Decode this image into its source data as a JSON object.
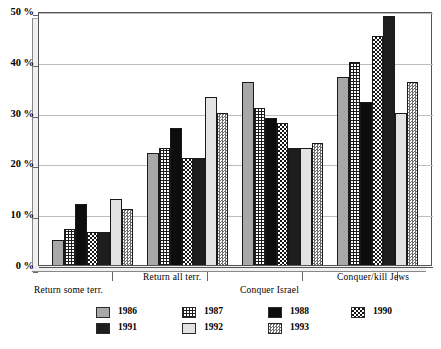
{
  "chart_data": {
    "type": "bar",
    "title": "",
    "subtitle": "",
    "xlabel": "",
    "ylabel": "",
    "ylim": [
      0,
      50
    ],
    "ytick_labels": [
      "0 %",
      "10 %",
      "20 %",
      "30 %",
      "40 %",
      "50 %"
    ],
    "ytick_values": [
      0,
      10,
      20,
      30,
      40,
      50
    ],
    "yaxis_unit": "%",
    "grid": true,
    "legend_position": "bottom",
    "categories": [
      "Return some terr.",
      "Return all terr.",
      "Conquer Israel",
      "Conquer/kill Jews"
    ],
    "series": [
      {
        "name": "1986",
        "pattern": "solid-gray",
        "values": [
          5,
          22,
          36,
          37
        ]
      },
      {
        "name": "1987",
        "pattern": "fine-grid",
        "values": [
          7,
          23,
          31,
          40
        ]
      },
      {
        "name": "1988",
        "pattern": "solid-black",
        "values": [
          12,
          27,
          29,
          32
        ]
      },
      {
        "name": "1990",
        "pattern": "checkerboard-dark",
        "values": [
          6.5,
          21,
          28,
          45
        ]
      },
      {
        "name": "1991",
        "pattern": "solid-dark",
        "values": [
          6.5,
          21,
          23,
          49
        ]
      },
      {
        "name": "1992",
        "pattern": "solid-light",
        "values": [
          13,
          33,
          23,
          30
        ]
      },
      {
        "name": "1993",
        "pattern": "checkerboard-gray",
        "values": [
          11,
          30,
          24,
          36
        ]
      }
    ]
  },
  "legend": {
    "items": [
      {
        "label": "1986"
      },
      {
        "label": "1987"
      },
      {
        "label": "1988"
      },
      {
        "label": "1990"
      },
      {
        "label": "1991"
      },
      {
        "label": "1992"
      },
      {
        "label": "1993"
      }
    ]
  },
  "colors": {
    "series_1986": "#a8a8a8",
    "series_1988": "#0d0d0d",
    "series_1991": "#1e1e1e",
    "series_1992": "#e3e3e3",
    "grid": "#bdbdbd",
    "axis": "#555555",
    "background": "#ffffff"
  }
}
